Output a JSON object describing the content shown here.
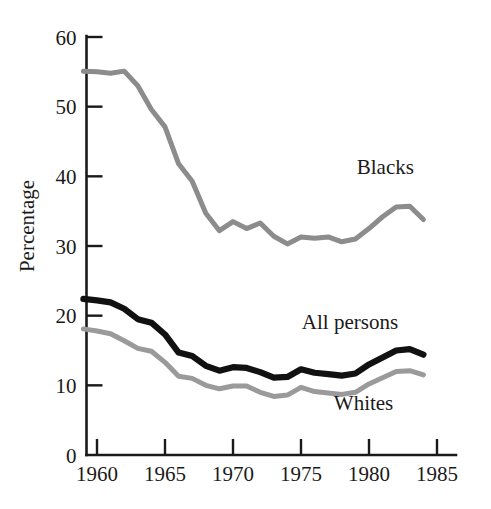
{
  "chart_data": {
    "type": "line",
    "title": "",
    "subtitle": "",
    "xlabel": "",
    "ylabel": "Percentage",
    "xlim": [
      1959,
      1985
    ],
    "ylim": [
      0,
      60
    ],
    "xticks": [
      1960,
      1965,
      1970,
      1975,
      1980,
      1985
    ],
    "xtick_labels": [
      "1960",
      "1965",
      "1970",
      "1975",
      "1980",
      "1985"
    ],
    "yticks": [
      0,
      10,
      20,
      30,
      40,
      50,
      60
    ],
    "ytick_labels": [
      "0",
      "10",
      "20",
      "30",
      "40",
      "50",
      "60"
    ],
    "grid": false,
    "legend_position": "inline-annotations",
    "x": [
      1959,
      1960,
      1961,
      1962,
      1963,
      1964,
      1965,
      1966,
      1967,
      1968,
      1969,
      1970,
      1971,
      1972,
      1973,
      1974,
      1975,
      1976,
      1977,
      1978,
      1979,
      1980,
      1981,
      1982,
      1983,
      1984
    ],
    "series": [
      {
        "name": "Blacks",
        "color": "#8c8c8c",
        "label_text": "Blacks",
        "values": [
          55.1,
          55.0,
          54.8,
          55.1,
          53.0,
          49.6,
          47.1,
          41.8,
          39.3,
          34.7,
          32.2,
          33.5,
          32.5,
          33.3,
          31.4,
          30.3,
          31.3,
          31.1,
          31.3,
          30.6,
          31.0,
          32.5,
          34.2,
          35.6,
          35.7,
          33.8
        ]
      },
      {
        "name": "All persons",
        "color": "#111111",
        "label_text": "All persons",
        "values": [
          22.4,
          22.2,
          21.9,
          21.0,
          19.5,
          19.0,
          17.3,
          14.7,
          14.2,
          12.8,
          12.1,
          12.6,
          12.5,
          11.9,
          11.1,
          11.2,
          12.3,
          11.8,
          11.6,
          11.4,
          11.7,
          13.0,
          14.0,
          15.0,
          15.2,
          14.4
        ]
      },
      {
        "name": "Whites",
        "color": "#9a9a9a",
        "label_text": "Whites",
        "values": [
          18.1,
          17.8,
          17.4,
          16.4,
          15.3,
          14.9,
          13.3,
          11.3,
          11.0,
          10.0,
          9.5,
          9.9,
          9.9,
          9.0,
          8.4,
          8.6,
          9.7,
          9.1,
          8.9,
          8.7,
          9.0,
          10.2,
          11.1,
          12.0,
          12.1,
          11.5
        ]
      }
    ],
    "annotations": [
      {
        "text": "Blacks",
        "x": 1981.2,
        "y": 40.4
      },
      {
        "text": "All persons",
        "x": 1978.6,
        "y": 18.1
      },
      {
        "text": "Whites",
        "x": 1979.6,
        "y": 6.4
      }
    ]
  }
}
